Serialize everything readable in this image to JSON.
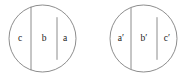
{
  "figure": {
    "background_color": "#ffffff",
    "stroke_color": "#808080",
    "label_color": "#1a1a1a",
    "stroke_width": 0.9,
    "circles": [
      {
        "id": "left-circle",
        "name": "left-circle",
        "cx": 42.5,
        "cy": 38.5,
        "r": 33.5,
        "chords_x": [
          31,
          57
        ],
        "regions": [
          {
            "id": "left-region-c",
            "label": "c",
            "label_x": 20,
            "label_y": 38.5
          },
          {
            "id": "left-region-b",
            "label": "b",
            "label_x": 44,
            "label_y": 38.5
          },
          {
            "id": "left-region-a",
            "label": "a",
            "label_x": 65,
            "label_y": 38.5
          }
        ]
      },
      {
        "id": "right-circle",
        "name": "right-circle",
        "cx": 143.5,
        "cy": 38.5,
        "r": 33.5,
        "chords_x": [
          131,
          157
        ],
        "regions": [
          {
            "id": "right-region-a-prime",
            "label": "a′",
            "label_x": 121,
            "label_y": 38.5
          },
          {
            "id": "right-region-b-prime",
            "label": "b′",
            "label_x": 144,
            "label_y": 38.5
          },
          {
            "id": "right-region-c-prime",
            "label": "c′",
            "label_x": 167,
            "label_y": 38.5
          }
        ]
      }
    ]
  }
}
